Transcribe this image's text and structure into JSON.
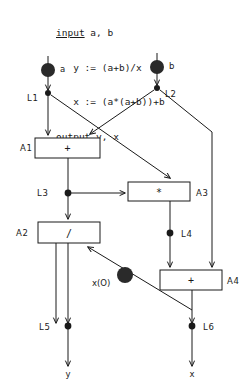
{
  "program": {
    "lines": [
      {
        "keyword": "input",
        "rest": " a, b"
      },
      {
        "keyword": "",
        "rest": "   y := (a+b)/x"
      },
      {
        "keyword": "",
        "rest": "   x := (a*(a+b))+b"
      },
      {
        "keyword": "output",
        "rest": " y, x"
      }
    ],
    "full_text": "input a, b\n   y := (a+b)/x\n   x := (a*(a+b))+b\noutput y, x"
  },
  "graph": {
    "title": "dataflow-graph",
    "source_nodes": [
      {
        "id": "src-a",
        "label": "a",
        "cx": 48,
        "cy": 70,
        "r": 7,
        "label_x": 60,
        "label_y": 71
      },
      {
        "id": "src-b",
        "label": "b",
        "cx": 157,
        "cy": 67,
        "r": 7,
        "label_x": 169,
        "label_y": 68
      }
    ],
    "link_nodes": [
      {
        "id": "L1",
        "label": "L1",
        "cx": 48,
        "cy": 93,
        "r": 3,
        "label_x": 28,
        "label_y": 100
      },
      {
        "id": "L2",
        "label": "L2",
        "cx": 157,
        "cy": 88,
        "r": 3,
        "label_x": 165,
        "label_y": 96
      },
      {
        "id": "L3",
        "label": "L3",
        "cx": 68,
        "cy": 193,
        "r": 3.4,
        "label_x": 38,
        "label_y": 196
      },
      {
        "id": "L4",
        "label": "L4",
        "cx": 170,
        "cy": 233,
        "r": 3.4,
        "label_x": 181,
        "label_y": 236
      },
      {
        "id": "L5",
        "label": "L5",
        "cx": 68,
        "cy": 326,
        "r": 3.4,
        "label_x": 40,
        "label_y": 329
      },
      {
        "id": "L6",
        "label": "L6",
        "cx": 192,
        "cy": 326,
        "r": 3.4,
        "label_x": 203,
        "label_y": 329
      }
    ],
    "token_nodes": [
      {
        "id": "x0",
        "label": "x(O)",
        "cx": 125,
        "cy": 275,
        "r": 8,
        "label_x": 93,
        "label_y": 285
      }
    ],
    "actor_boxes": [
      {
        "id": "A1",
        "op": "+",
        "label": "A1",
        "x": 35,
        "y": 138,
        "w": 65,
        "h": 20,
        "label_x": 20,
        "label_y": 151
      },
      {
        "id": "A3",
        "op": "*",
        "label": "A3",
        "x": 128,
        "y": 182,
        "w": 62,
        "h": 19,
        "label_x": 196,
        "label_y": 195
      },
      {
        "id": "A2",
        "op": "/",
        "label": "A2",
        "x": 38,
        "y": 222,
        "w": 62,
        "h": 21,
        "label_x": 17,
        "label_y": 236
      },
      {
        "id": "A4",
        "op": "+",
        "label": "A4",
        "x": 160,
        "y": 270,
        "w": 62,
        "h": 20,
        "label_x": 228,
        "label_y": 283
      }
    ],
    "output_labels": [
      {
        "id": "out-y",
        "label": "y",
        "x": 68,
        "y": 376
      },
      {
        "id": "out-x",
        "label": "x",
        "x": 192,
        "y": 376
      }
    ]
  },
  "colors": {
    "ink": "#1a1a1a",
    "paper": "#ffffff"
  }
}
